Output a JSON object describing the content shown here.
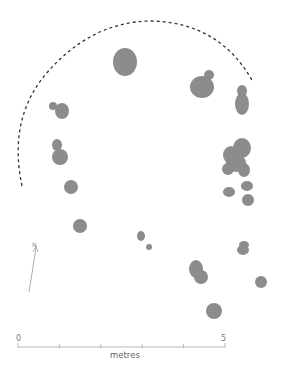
{
  "figure": {
    "type": "site-plan",
    "feature_color": "#8c8c8c",
    "line_color": "#333333",
    "scale_color": "#aaaaaa"
  },
  "north_arrow": {
    "label": "N"
  },
  "scale_bar": {
    "start_label": "0",
    "end_label": "5",
    "unit_label": "metres",
    "divisions": 5
  },
  "features": [
    {
      "id": "pit-top-center",
      "shape": "ellipse",
      "cx": 125,
      "cy": 62,
      "rx": 12,
      "ry": 14
    },
    {
      "id": "pit-ne-large",
      "shape": "ellipse",
      "cx": 202,
      "cy": 87,
      "rx": 12,
      "ry": 11
    },
    {
      "id": "pit-ne-small",
      "shape": "ellipse",
      "cx": 209,
      "cy": 75,
      "rx": 5,
      "ry": 5
    },
    {
      "id": "pit-e-upper-a",
      "shape": "ellipse",
      "cx": 242,
      "cy": 91,
      "rx": 5,
      "ry": 6
    },
    {
      "id": "pit-e-upper-b",
      "shape": "ellipse",
      "cx": 242,
      "cy": 104,
      "rx": 7,
      "ry": 11
    },
    {
      "id": "pit-w-1a",
      "shape": "ellipse",
      "cx": 53,
      "cy": 106,
      "rx": 4,
      "ry": 4
    },
    {
      "id": "pit-w-1b",
      "shape": "ellipse",
      "cx": 62,
      "cy": 111,
      "rx": 7,
      "ry": 8
    },
    {
      "id": "pit-w-2a",
      "shape": "ellipse",
      "cx": 57,
      "cy": 145,
      "rx": 5,
      "ry": 6
    },
    {
      "id": "pit-w-2b",
      "shape": "ellipse",
      "cx": 60,
      "cy": 157,
      "rx": 8,
      "ry": 8
    },
    {
      "id": "pit-w-3",
      "shape": "ellipse",
      "cx": 71,
      "cy": 187,
      "rx": 7,
      "ry": 7
    },
    {
      "id": "pit-w-4",
      "shape": "ellipse",
      "cx": 80,
      "cy": 226,
      "rx": 7,
      "ry": 7
    },
    {
      "id": "pit-e-cluster-a",
      "shape": "ellipse",
      "cx": 242,
      "cy": 148,
      "rx": 9,
      "ry": 10
    },
    {
      "id": "pit-e-cluster-b",
      "shape": "ellipse",
      "cx": 231,
      "cy": 155,
      "rx": 8,
      "ry": 9
    },
    {
      "id": "pit-e-cluster-c",
      "shape": "ellipse",
      "cx": 236,
      "cy": 163,
      "rx": 10,
      "ry": 9
    },
    {
      "id": "pit-e-cluster-d",
      "shape": "ellipse",
      "cx": 228,
      "cy": 169,
      "rx": 6,
      "ry": 6
    },
    {
      "id": "pit-e-cluster-e",
      "shape": "ellipse",
      "cx": 244,
      "cy": 170,
      "rx": 6,
      "ry": 7
    },
    {
      "id": "pit-e-small-1",
      "shape": "ellipse",
      "cx": 229,
      "cy": 192,
      "rx": 6,
      "ry": 5
    },
    {
      "id": "pit-e-small-2",
      "shape": "ellipse",
      "cx": 247,
      "cy": 186,
      "rx": 6,
      "ry": 5
    },
    {
      "id": "pit-e-small-3",
      "shape": "ellipse",
      "cx": 248,
      "cy": 200,
      "rx": 6,
      "ry": 6
    },
    {
      "id": "pit-center-a",
      "shape": "ellipse",
      "cx": 141,
      "cy": 236,
      "rx": 4,
      "ry": 5
    },
    {
      "id": "pit-center-b",
      "shape": "ellipse",
      "cx": 149,
      "cy": 247,
      "rx": 3,
      "ry": 3
    },
    {
      "id": "pit-e-lower-a",
      "shape": "ellipse",
      "cx": 244,
      "cy": 245,
      "rx": 5,
      "ry": 4
    },
    {
      "id": "pit-e-lower-b",
      "shape": "ellipse",
      "cx": 243,
      "cy": 250,
      "rx": 6,
      "ry": 5
    },
    {
      "id": "pit-s-a",
      "shape": "ellipse",
      "cx": 196,
      "cy": 269,
      "rx": 7,
      "ry": 9
    },
    {
      "id": "pit-s-b",
      "shape": "ellipse",
      "cx": 201,
      "cy": 277,
      "rx": 7,
      "ry": 7
    },
    {
      "id": "pit-se",
      "shape": "ellipse",
      "cx": 261,
      "cy": 282,
      "rx": 6,
      "ry": 6
    },
    {
      "id": "pit-s-bottom",
      "shape": "ellipse",
      "cx": 214,
      "cy": 311,
      "rx": 8,
      "ry": 8
    }
  ],
  "boundary_arc": {
    "path": "M 22 186 Q 8 120 45 75 Q 90 22 150 21 Q 220 22 253 82",
    "dash": "3,3"
  }
}
